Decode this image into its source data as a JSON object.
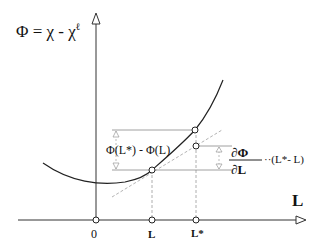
{
  "title_formula": {
    "lhs": "Φ =",
    "term1": "χ",
    "minus": "-",
    "term2": "χ",
    "sup": "ℓ"
  },
  "axes": {
    "x_label": "L",
    "origin_label": "0"
  },
  "ticks": [
    {
      "label": "L",
      "x": 152
    },
    {
      "label": "L*",
      "x": 196
    }
  ],
  "annotations": {
    "difference": "Φ(L*) - Φ(L)",
    "derivative_num": "∂Φ",
    "derivative_den": "∂L",
    "derivative_tail": "··(L*- L)"
  },
  "colors": {
    "line": "#222222",
    "guide": "#999999",
    "tangent": "#aaaaaa"
  }
}
